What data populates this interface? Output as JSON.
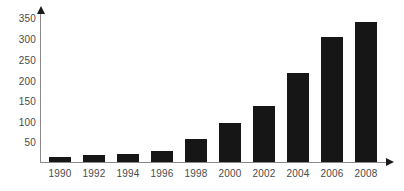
{
  "chart_data": {
    "type": "bar",
    "title": "",
    "subtitle": "",
    "xlabel": "",
    "ylabel": "",
    "categories": [
      "1990",
      "1992",
      "1994",
      "1996",
      "1998",
      "2000",
      "2002",
      "2004",
      "2006",
      "2008"
    ],
    "values": [
      12,
      17,
      20,
      27,
      57,
      98,
      140,
      220,
      310,
      348
    ],
    "series": [
      {
        "name": "",
        "values": [
          12,
          17,
          20,
          27,
          57,
          98,
          140,
          220,
          310,
          348
        ]
      }
    ],
    "ylim": [
      0,
      365
    ],
    "yticks": [
      50,
      100,
      150,
      200,
      250,
      300,
      350
    ],
    "ytick_labels": [
      "50",
      "100",
      "150",
      "200",
      "250",
      "300",
      "350"
    ],
    "xtick_labels": [
      "1990",
      "1992",
      "1994",
      "1996",
      "1998",
      "2000",
      "2002",
      "2004",
      "2006",
      "2008"
    ],
    "grid": false,
    "legend": null,
    "legend_position": "none",
    "annotations": [],
    "bar_color": "#161616",
    "axis_color": "#8a8a8a",
    "tick_label_color": "#4a4a4a",
    "background_color": "#ffffff",
    "axis_arrows": {
      "y_axis": "arrow-up-icon",
      "x_axis": "arrow-right-icon"
    }
  }
}
